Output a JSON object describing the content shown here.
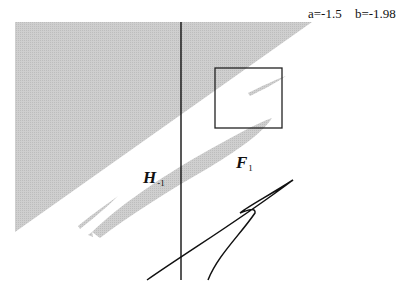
{
  "parameters": {
    "a_label": "a=-1.5",
    "b_label": "b=-1.98"
  },
  "labels": {
    "h_region": {
      "main": "H",
      "sub": "-1"
    },
    "f_region": {
      "main": "F",
      "sub": "1"
    }
  },
  "colors": {
    "shaded_region": "#c8c8c8",
    "lines": "#111111",
    "background": "#ffffff"
  }
}
